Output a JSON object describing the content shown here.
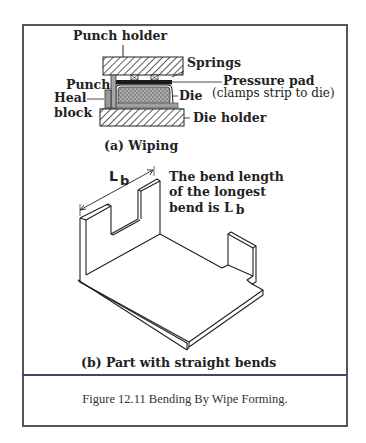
{
  "figure": {
    "number": "Figure 12.11",
    "caption": "Figure  12.11  Bending By Wipe Forming."
  },
  "part_a": {
    "title": "(a)  Wiping",
    "labels": {
      "punch_holder": "Punch holder",
      "springs": "Springs",
      "pressure_pad": "Pressure pad",
      "pressure_pad_note": "(clamps strip to die)",
      "punch": "Punch",
      "die": "Die",
      "heal": "Heal",
      "block": "block",
      "die_holder": "Die holder"
    }
  },
  "part_b": {
    "title": "(b)  Part with straight bends",
    "dimension_label": "L",
    "dimension_subscript": "b",
    "note_lines": [
      "The bend length",
      "of the longest",
      "bend is L"
    ],
    "note_subscript": "b"
  },
  "colors": {
    "frame": "#555555",
    "divider": "#4a3f6b",
    "hatch": "#333333",
    "pressure_pad": "#1a1a1a",
    "die_fill": "#9a9a9a",
    "strip_green": "#7fcf7f"
  }
}
